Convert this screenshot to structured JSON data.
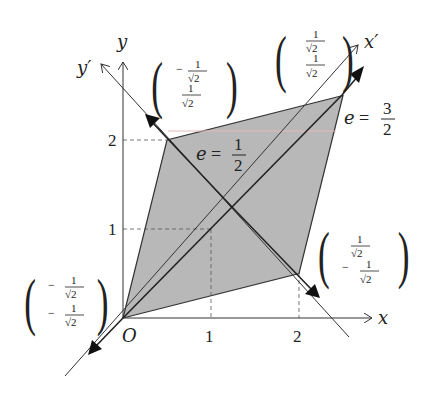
{
  "diagram": {
    "axes": {
      "x_label": "x",
      "y_label": "y",
      "x_prime_label": "x′",
      "y_prime_label": "y′",
      "origin_label": "O",
      "x_ticks": [
        "1",
        "2"
      ],
      "y_ticks": [
        "1",
        "2"
      ]
    },
    "parallelogram": {
      "vertices": [
        [
          0,
          0
        ],
        [
          2,
          0.5
        ],
        [
          2.5,
          2.5
        ],
        [
          0.5,
          2
        ]
      ],
      "fill_color": "#b8b8b8",
      "stroke_color": "#333333"
    },
    "eigen_labels": {
      "small": {
        "lhs": "e",
        "eq": "=",
        "num": "1",
        "den": "2"
      },
      "large": {
        "lhs": "e",
        "eq": "=",
        "num": "3",
        "den": "2"
      }
    },
    "vectors": {
      "upper_right": {
        "top_sign": "",
        "top_num": "1",
        "top_den": "√2",
        "bot_sign": "",
        "bot_num": "1",
        "bot_den": "√2"
      },
      "upper_left": {
        "top_sign": "−",
        "top_num": "1",
        "top_den": "√2",
        "bot_sign": "",
        "bot_num": "1",
        "bot_den": "√2"
      },
      "lower_right": {
        "top_sign": "",
        "top_num": "1",
        "top_den": "√2",
        "bot_sign": "−",
        "bot_num": "1",
        "bot_den": "√2"
      },
      "lower_left": {
        "top_sign": "−",
        "top_num": "1",
        "top_den": "√2",
        "bot_sign": "−",
        "bot_num": "1",
        "bot_den": "√2"
      }
    },
    "paren_left": "(",
    "paren_right": ")"
  }
}
